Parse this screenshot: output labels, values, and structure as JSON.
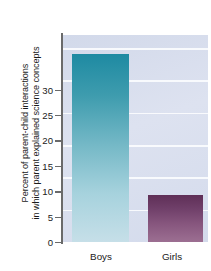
{
  "chart_data": {
    "type": "bar",
    "title": "",
    "subtitle": "",
    "xlabel": "",
    "ylabel_lines": [
      "Percent of parent-child interactions",
      "in which parent explained science concepts"
    ],
    "ylabel": "Percent of parent-child interactions in which parent explained science concepts",
    "categories": [
      "Boys",
      "Girls"
    ],
    "values": [
      29,
      7.2
    ],
    "ylim": [
      0,
      32
    ],
    "yticks": [
      0,
      5,
      10,
      15,
      20,
      25,
      30
    ],
    "ytick_labels": [
      "0",
      "5",
      "10",
      "15",
      "20",
      "25",
      "30"
    ],
    "grid": true,
    "gridlines_at": [
      5,
      10,
      15,
      20,
      25,
      30
    ],
    "legend": "none",
    "legend_position": "none",
    "bar_colors": [
      "#1e8aa2",
      "#5f2f57"
    ],
    "bar_colors_bottom": [
      "#c6dfe8",
      "#9c6f92"
    ],
    "plot_background": "#d6dcec",
    "gridline_color": "#fbfcfe",
    "axis_color": "#6a6a6a",
    "text_color": "#1b1b1b",
    "page_background": "#ffffff"
  }
}
